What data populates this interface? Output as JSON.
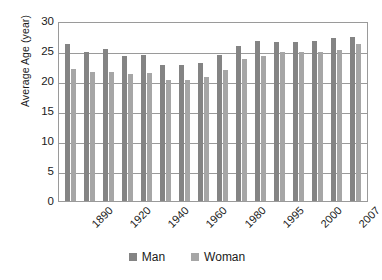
{
  "chart_data": {
    "type": "bar",
    "title": "",
    "subtitle": "",
    "xlabel": "",
    "ylabel": "Average Age (year)",
    "ylim": [
      0,
      30
    ],
    "yticks": [
      0,
      5,
      10,
      15,
      20,
      25,
      30
    ],
    "ytick_labels": [
      "0",
      "5",
      "10",
      "15",
      "20",
      "25",
      "30"
    ],
    "grid": true,
    "legend_position": "bottom",
    "bar_orientation": "vertical",
    "grouping": "grouped",
    "categories": [
      "1890",
      "1900",
      "1910",
      "1920",
      "1930",
      "1940",
      "1950",
      "1960",
      "1970",
      "1980",
      "1990",
      "1995",
      "1998",
      "2000",
      "2005",
      "2007"
    ],
    "xtick_labels_shown": [
      "1890",
      "1920",
      "1940",
      "1960",
      "1980",
      "1995",
      "2000",
      "2007"
    ],
    "xtick_label_rotation": -45,
    "series": [
      {
        "name": "Man",
        "color": "#848484",
        "values": [
          26.1,
          24.9,
          25.4,
          24.2,
          24.3,
          22.7,
          22.7,
          23.0,
          24.4,
          25.9,
          26.6,
          26.5,
          26.5,
          26.6,
          27.2,
          27.3
        ]
      },
      {
        "name": "Woman",
        "color": "#a6a6a6",
        "values": [
          22.0,
          21.5,
          21.5,
          21.2,
          21.4,
          20.1,
          20.1,
          20.6,
          21.8,
          23.7,
          24.2,
          24.8,
          24.8,
          24.8,
          25.1,
          26.2
        ]
      }
    ]
  },
  "legend": {
    "items": [
      {
        "label": "Man",
        "color": "#848484"
      },
      {
        "label": "Woman",
        "color": "#a6a6a6"
      }
    ]
  },
  "axes": {
    "y_title": "Average Age (year)"
  },
  "colors": {
    "man": "#848484",
    "woman": "#a6a6a6",
    "gridline": "#9a9a9a",
    "text": "#1a1a1a",
    "background": "#ffffff"
  }
}
